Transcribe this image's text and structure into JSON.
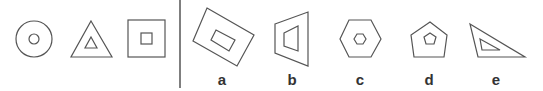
{
  "puzzle": {
    "type": "figure-series-analogy",
    "sequence": [
      {
        "id": "circle-pair",
        "shape": "circle",
        "description": "circle with small concentric circle"
      },
      {
        "id": "triangle-pair",
        "shape": "triangle",
        "description": "triangle with small concentric triangle"
      },
      {
        "id": "square-pair",
        "shape": "square",
        "description": "square with small concentric square"
      }
    ],
    "options": [
      {
        "label": "a",
        "shape": "rotated-rectangle",
        "description": "tilted rectangle with small tilted rectangle inside"
      },
      {
        "label": "b",
        "shape": "trapezoid",
        "description": "trapezoid with small trapezoid inside"
      },
      {
        "label": "c",
        "shape": "hexagon",
        "description": "hexagon with small concentric hexagon"
      },
      {
        "label": "d",
        "shape": "pentagon",
        "description": "pentagon with small concentric pentagon"
      },
      {
        "label": "e",
        "shape": "right-triangle",
        "description": "right triangle with small triangle inside"
      }
    ]
  },
  "colors": {
    "stroke": "#555555",
    "label": "#333333",
    "background": "#ffffff"
  }
}
